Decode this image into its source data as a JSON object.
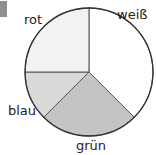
{
  "marker_color": "#8f8f8f",
  "chart_data": {
    "type": "pie",
    "title": "",
    "categories": [
      "weiß",
      "grün",
      "blau",
      "rot"
    ],
    "values": [
      37.5,
      25,
      12.5,
      25
    ],
    "unit": "%",
    "start_angle_deg": 0,
    "direction": "clockwise",
    "colors": [
      "#ffffff",
      "#c4c4c4",
      "#d9d9d9",
      "#f2f2f2"
    ],
    "legend": "none (labels placed outside slices)"
  },
  "labels": {
    "weiss": "weiß",
    "gruen": "grün",
    "blau": "blau",
    "rot": "rot"
  }
}
